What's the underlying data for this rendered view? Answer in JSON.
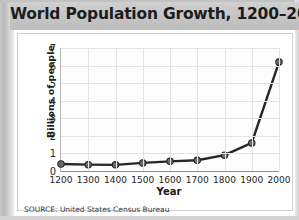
{
  "figure": {
    "title": "World Population Growth, 1200–2000",
    "source": "SOURCE:  United States Census Bureau"
  },
  "chart_data": {
    "type": "line",
    "title": "World Population Growth, 1200–2000",
    "xlabel": "Year",
    "ylabel": "Billions of people",
    "x": [
      1200,
      1300,
      1400,
      1500,
      1600,
      1700,
      1800,
      1900,
      2000
    ],
    "values": [
      0.4,
      0.36,
      0.35,
      0.46,
      0.55,
      0.61,
      0.9,
      1.6,
      6.2
    ],
    "categories": [
      "1200",
      "1300",
      "1400",
      "1500",
      "1600",
      "1700",
      "1800",
      "1900",
      "2000"
    ],
    "xlim": [
      1200,
      2000
    ],
    "ylim": [
      0,
      7
    ],
    "xticks": [
      "1200",
      "1300",
      "1400",
      "1500",
      "1600",
      "1700",
      "1800",
      "1900",
      "2000"
    ],
    "yticks": [
      "0",
      "1",
      "2",
      "3",
      "4",
      "5",
      "6",
      "7"
    ],
    "grid": true,
    "legend": false,
    "series_color": "#262626",
    "marker_color": "#6b6b6b",
    "grid_color": "#e2e2e2"
  }
}
